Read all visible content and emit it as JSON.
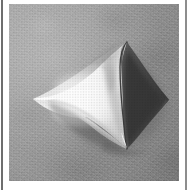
{
  "page": {
    "background_color": "#ffffff",
    "width": 189,
    "height": 190
  },
  "rules": {
    "left_color": "#6e6e6e",
    "right_color": "#8d8d8d"
  },
  "plate": {
    "caption": "",
    "x": 9,
    "y": 4,
    "width": 170,
    "height": 177,
    "background_color": "#9b9b9b"
  },
  "photograph": {
    "subject_name": "hyperbolic-paraboloid-saddle-model",
    "description": "Photograph of a white plaster mathematical surface model with four sharp cusped corners, resembling a saddle or hyperbolic paraboloid, resting on a mottled grey studio backdrop.",
    "medium": "black-and-white halftone photograph",
    "lighting": "strong light from the upper left; deep shadow on the right flank and cast shadow to the lower right",
    "colors": {
      "highlight": "#fdfdfd",
      "midtone": "#d5d5d5",
      "shadow_surface": "#4a4a4a",
      "deep_shadow": "#3a3a3a",
      "cast_shadow": "#6a6a6a",
      "backdrop": "#9b9b9b",
      "backdrop_dark": "#828282",
      "edge_line": "#2e2e2e"
    },
    "features": [
      {
        "name": "left-cusp-tip",
        "x": 24,
        "y": 95
      },
      {
        "name": "top-cusp-tip",
        "x": 119,
        "y": 38
      },
      {
        "name": "bottom-cusp-tip",
        "x": 118,
        "y": 145
      },
      {
        "name": "right-cusp-tip",
        "x": 160,
        "y": 96
      },
      {
        "name": "central-saddle-highlight",
        "x": 78,
        "y": 92
      },
      {
        "name": "pencil-construction-marks",
        "x": 92,
        "y": 48
      }
    ]
  }
}
